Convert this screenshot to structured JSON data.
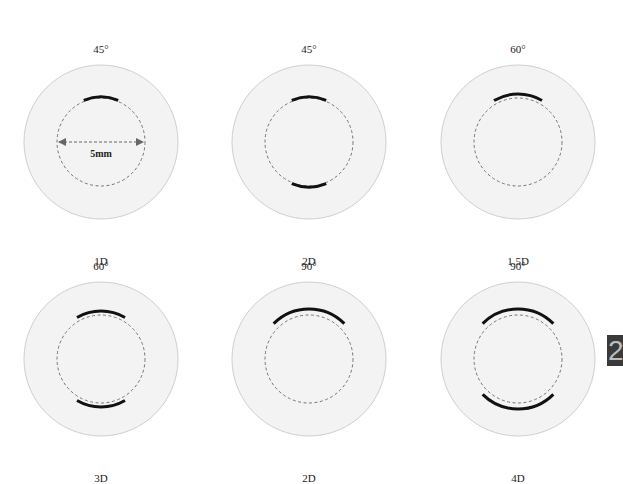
{
  "colors": {
    "cornea_fill": "#f3f3f3",
    "cornea_stroke": "#cfcfcf",
    "optical_zone_dash": "#666666",
    "incision": "#111111",
    "tab_background": "#3a3a3a",
    "tab_text": "#bdbdbd"
  },
  "diagrams": [
    {
      "angle": "45°",
      "power": "1D",
      "arcs": [
        {
          "center_deg": 270,
          "span_deg": 45,
          "radius": 45
        }
      ],
      "dimension_label": "5mm"
    },
    {
      "angle": "45°",
      "power": "2D",
      "arcs": [
        {
          "center_deg": 270,
          "span_deg": 45,
          "radius": 45
        },
        {
          "center_deg": 90,
          "span_deg": 45,
          "radius": 45
        }
      ]
    },
    {
      "angle": "60°",
      "power": "1.5D",
      "arcs": [
        {
          "center_deg": 270,
          "span_deg": 60,
          "radius": 48
        }
      ]
    },
    {
      "angle": "60°",
      "power": "3D",
      "arcs": [
        {
          "center_deg": 270,
          "span_deg": 60,
          "radius": 48
        },
        {
          "center_deg": 90,
          "span_deg": 60,
          "radius": 48
        }
      ]
    },
    {
      "angle": "90°",
      "power": "2D",
      "arcs": [
        {
          "center_deg": 270,
          "span_deg": 90,
          "radius": 50
        }
      ]
    },
    {
      "angle": "90°",
      "power": "4D",
      "arcs": [
        {
          "center_deg": 270,
          "span_deg": 90,
          "radius": 50
        },
        {
          "center_deg": 90,
          "span_deg": 90,
          "radius": 50
        }
      ]
    }
  ],
  "geometry": {
    "outer_radius": 77,
    "optical_zone_radius": 44
  },
  "chapter_tab": {
    "label": "2"
  }
}
